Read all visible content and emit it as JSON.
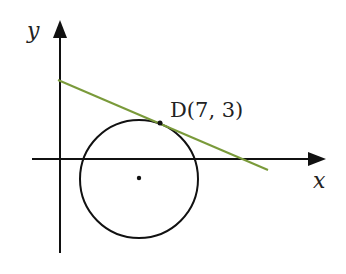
{
  "diagram": {
    "axes": {
      "x_label": "x",
      "y_label": "y",
      "color": "#111111"
    },
    "circle": {
      "center_marked": true,
      "color": "#111111"
    },
    "tangent_line": {
      "color": "#7a9a3a"
    },
    "point": {
      "label": "D(7, 3)",
      "name": "D",
      "x": 7,
      "y": 3
    }
  }
}
